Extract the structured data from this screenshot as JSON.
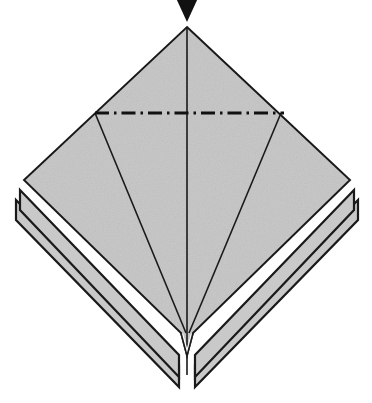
{
  "document": {
    "kind": "origami-fold-diagram",
    "title": "Origami step diagram",
    "background_color": "#ffffff"
  },
  "palette": {
    "paper_fill": "#c9c9c9",
    "paper_fill_shadow": "#bdbdbd",
    "outline": "#1a1a1a",
    "crease": "#1a1a1a",
    "mountain_fold": "#111111",
    "arrow": "#111111",
    "white": "#ffffff"
  },
  "canvas": {
    "width": 372,
    "height": 403
  },
  "geometry": {
    "diamond": {
      "top": [
        187,
        27
      ],
      "left": [
        24,
        180
      ],
      "right": [
        350,
        180
      ],
      "bottom": [
        187,
        375
      ],
      "points": "187,27 350,180 187,375 24,180"
    },
    "center_line": {
      "from": [
        187,
        27
      ],
      "to": [
        187,
        375
      ]
    },
    "fan_left": {
      "from": [
        95,
        113
      ],
      "to": [
        186,
        333
      ]
    },
    "fan_right": {
      "from": [
        281,
        113
      ],
      "to": [
        189,
        333
      ]
    },
    "layer_offsets": [
      {
        "dx": -4,
        "dy": 10
      },
      {
        "dx": -8,
        "dy": 20
      }
    ],
    "notch": {
      "apex": [
        187,
        333
      ],
      "depth": 22
    }
  },
  "mountain_fold": {
    "label": "mountain-fold-line",
    "style": "dash-dot",
    "y": 113,
    "x_start": 95,
    "x_end": 284,
    "dash_pattern": "14 5 2.5 5",
    "stroke_width": 3.2
  },
  "arrow": {
    "label": "fold-direction-arrow",
    "direction": "down",
    "tip": [
      187,
      22
    ],
    "width": 22,
    "height": 24,
    "clipped_at_top": true
  },
  "creases": [
    {
      "name": "vertical-center-crease",
      "type": "valley-edge"
    },
    {
      "name": "left-fan-crease",
      "type": "edge"
    },
    {
      "name": "right-fan-crease",
      "type": "edge"
    }
  ],
  "layers": [
    {
      "name": "layer-back-2",
      "z": 0
    },
    {
      "name": "layer-back-1",
      "z": 1
    },
    {
      "name": "layer-front",
      "z": 2
    }
  ]
}
